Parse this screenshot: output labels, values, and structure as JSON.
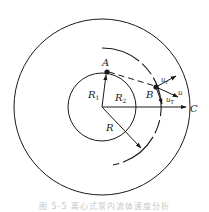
{
  "figure": {
    "center": {
      "x": 102,
      "y": 107
    },
    "outer_circle_radius": 88,
    "inner_circle_radius": 34,
    "dashed_arc_radius": 57,
    "stroke_color": "#1a1a1a",
    "labels": {
      "A": "A",
      "B": "B",
      "C": "C",
      "R1": "R",
      "R1_sub": "1",
      "R2": "R",
      "R2_sub": "2",
      "R": "R",
      "ur": "u",
      "ur_sub": "r",
      "u": "u",
      "uT": "u",
      "uT_sub": "T"
    },
    "points": {
      "A": {
        "x": 107,
        "y": 72
      },
      "B": {
        "x": 156,
        "y": 87
      },
      "C_arrow_tip": {
        "x": 186,
        "y": 107
      }
    }
  },
  "caption": "图 5-5   离心式泵内流体速度分析"
}
